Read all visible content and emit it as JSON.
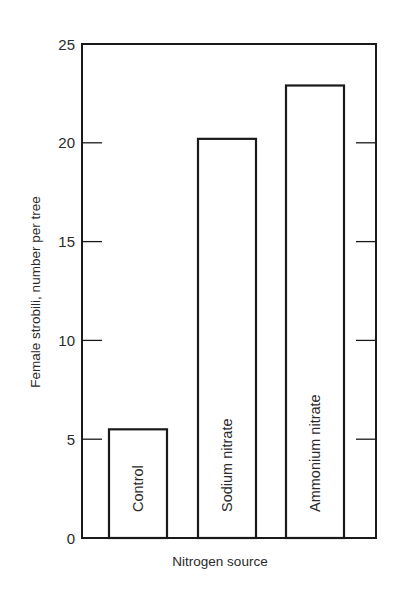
{
  "chart_data": {
    "type": "bar",
    "title": "",
    "xlabel": "Nitrogen source",
    "ylabel": "Female strobili, number per tree",
    "categories": [
      "Control",
      "Sodium nitrate",
      "Ammonium nitrate"
    ],
    "values": [
      5.5,
      20.2,
      22.9
    ],
    "ylim": [
      0,
      25
    ],
    "yticks": [
      0,
      5,
      10,
      15,
      20,
      25
    ],
    "ytick_labels": [
      "0",
      "5",
      "10",
      "15",
      "20",
      "25"
    ],
    "grid": false,
    "legend": null,
    "bar_labels_inside": true,
    "right_axis_ticks": [
      5,
      10,
      15,
      20
    ]
  },
  "colors": {
    "ink": "#1a1a1a",
    "bar_fill": "#ffffff",
    "background": "#ffffff"
  }
}
